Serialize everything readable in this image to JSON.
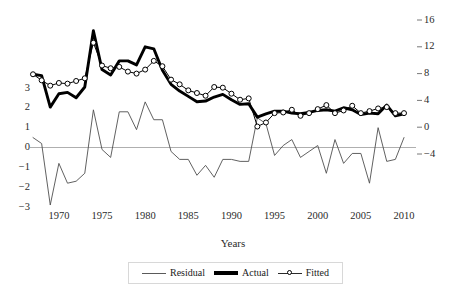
{
  "chart_data": {
    "type": "line",
    "title": "",
    "xlabel": "Years",
    "ylabel": "",
    "grid": false,
    "legend_position": "bottom",
    "x": [
      1967,
      1968,
      1969,
      1970,
      1971,
      1972,
      1973,
      1974,
      1975,
      1976,
      1977,
      1978,
      1979,
      1980,
      1981,
      1982,
      1983,
      1984,
      1985,
      1986,
      1987,
      1988,
      1989,
      1990,
      1991,
      1992,
      1993,
      1994,
      1995,
      1996,
      1997,
      1998,
      1999,
      2000,
      2001,
      2002,
      2003,
      2004,
      2005,
      2006,
      2007,
      2008,
      2009,
      2010
    ],
    "xlim": [
      1967,
      2010
    ],
    "xticks": [
      1970,
      1975,
      1980,
      1985,
      1990,
      1995,
      2000,
      2005,
      2010
    ],
    "xtick_labels": [
      "1970",
      "1975",
      "1980",
      "1985",
      "1990",
      "1995",
      "2000",
      "2005",
      "2010"
    ],
    "left_axis": {
      "name": "Residual",
      "ticks": [
        3,
        2,
        1,
        0,
        -1,
        -2,
        -3
      ],
      "tick_labels": [
        "3",
        "2",
        "1",
        "0",
        "−1",
        "−2",
        "−3"
      ],
      "ylim": [
        -3.6,
        3.4
      ]
    },
    "right_axis": {
      "name": "Actual / Fitted",
      "ticks": [
        16,
        12,
        8,
        4,
        0,
        -4
      ],
      "tick_labels": [
        "16",
        "12",
        "8",
        "4",
        "0",
        "−4"
      ],
      "ylim": [
        -5.4,
        17.2
      ]
    },
    "zero_line": 0,
    "series": [
      {
        "name": "Actual",
        "axis": "right",
        "style": "thick-line",
        "color": "#000000",
        "values": [
          7.9,
          7.7,
          3.0,
          5.0,
          5.2,
          4.4,
          6.0,
          14.4,
          8.6,
          7.8,
          9.9,
          9.9,
          9.3,
          12.0,
          11.7,
          8.5,
          6.4,
          5.4,
          4.6,
          3.8,
          3.9,
          4.5,
          4.9,
          4.1,
          3.4,
          3.5,
          1.5,
          2.0,
          2.4,
          2.4,
          2.1,
          2.0,
          2.2,
          2.5,
          2.6,
          2.4,
          2.9,
          2.6,
          1.9,
          2.1,
          2.0,
          3.3,
          1.7,
          2.0
        ]
      },
      {
        "name": "Fitted",
        "axis": "right",
        "style": "line-with-circle-markers",
        "color": "#000000",
        "marker": "open-circle",
        "values": [
          7.9,
          7.0,
          6.2,
          6.6,
          6.5,
          6.9,
          7.3,
          12.6,
          9.2,
          8.8,
          9.0,
          8.3,
          8.0,
          8.6,
          9.9,
          9.1,
          7.1,
          6.4,
          5.5,
          5.1,
          4.7,
          6.0,
          5.9,
          5.0,
          4.1,
          4.3,
          0.1,
          0.7,
          2.1,
          2.2,
          2.6,
          1.7,
          2.1,
          2.7,
          3.3,
          2.1,
          2.5,
          3.2,
          2.1,
          2.4,
          2.8,
          3.0,
          2.1,
          2.1
        ]
      },
      {
        "name": "Residual",
        "axis": "left",
        "style": "thin-line",
        "color": "#4f4f4f",
        "values": [
          0.5,
          0.2,
          -2.9,
          -0.8,
          -1.8,
          -1.7,
          -1.3,
          1.9,
          -0.1,
          -0.5,
          1.8,
          1.8,
          0.9,
          2.3,
          1.4,
          1.4,
          -0.2,
          -0.6,
          -0.6,
          -1.4,
          -0.9,
          -1.5,
          -0.6,
          -0.6,
          -0.7,
          -0.7,
          1.5,
          1.2,
          -0.4,
          0.1,
          0.4,
          -0.5,
          -0.2,
          0.1,
          -1.3,
          0.4,
          -0.8,
          -0.3,
          -0.3,
          -1.8,
          1.0,
          -0.7,
          -0.6,
          0.5
        ]
      }
    ]
  },
  "legend": {
    "items": [
      {
        "label": "Residual",
        "swatch": "thin-line-swatch"
      },
      {
        "label": "Actual",
        "swatch": "thick-line-swatch"
      },
      {
        "label": "Fitted",
        "swatch": "circle-marker-swatch"
      }
    ]
  },
  "axis_titles": {
    "x": "Years"
  }
}
